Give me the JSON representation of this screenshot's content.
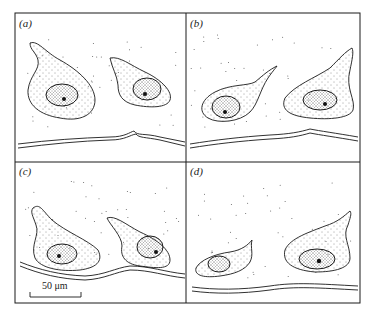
{
  "figure": {
    "panels": [
      {
        "id": "a",
        "label": "(a)"
      },
      {
        "id": "b",
        "label": "(b)"
      },
      {
        "id": "c",
        "label": "(c)"
      },
      {
        "id": "d",
        "label": "(d)"
      }
    ],
    "scale_bar": {
      "label": "50 μm"
    },
    "colors": {
      "ink": "#1a1a1a",
      "background": "#ffffff"
    }
  }
}
